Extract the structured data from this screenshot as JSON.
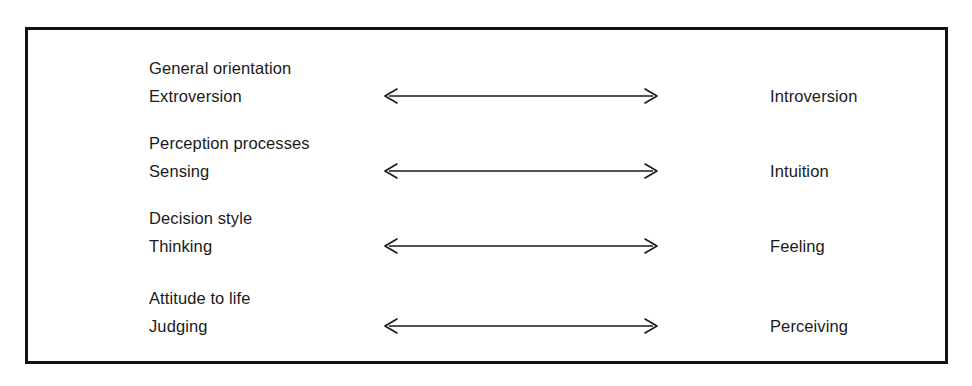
{
  "figure": {
    "border_color": "#111111",
    "background_color": "#ffffff",
    "text_color": "#1a1a1a",
    "arrow_color": "#1a1a1a",
    "rows": [
      {
        "category": "General orientation",
        "left_pole": "Extroversion",
        "right_pole": "Introversion",
        "arrow": "double-headed-horizontal-arrow"
      },
      {
        "category": "Perception processes",
        "left_pole": "Sensing",
        "right_pole": "Intuition",
        "arrow": "double-headed-horizontal-arrow"
      },
      {
        "category": "Decision style",
        "left_pole": "Thinking",
        "right_pole": "Feeling",
        "arrow": "double-headed-horizontal-arrow"
      },
      {
        "category": "Attitude to life",
        "left_pole": "Judging",
        "right_pole": "Perceiving",
        "arrow": "double-headed-horizontal-arrow"
      }
    ]
  }
}
